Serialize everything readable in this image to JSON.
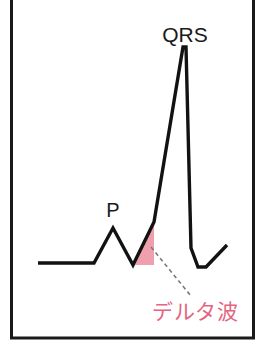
{
  "figure": {
    "background_color": "#ffffff",
    "frame": {
      "stroke_color": "#1a1a1a",
      "x": 11.5,
      "y": -6,
      "width": 242,
      "height": 344
    }
  },
  "labels": {
    "qrs": "QRS",
    "p": "P",
    "delta_wave": "デルタ波"
  },
  "colors": {
    "trace": "#121212",
    "delta_fill": "#ef9fae",
    "delta_text": "#e2667f",
    "leader_line": "#7a7a7a",
    "frame": "#1a1a1a"
  },
  "chart_data": {
    "type": "line",
    "xlabel": "",
    "ylabel": "",
    "grid": false,
    "legend": "none",
    "annotations": [
      {
        "name": "qrs-label",
        "text": "QRS",
        "x": 185,
        "y": 42,
        "color": "#1a1a1a"
      },
      {
        "name": "p-label",
        "text": "P",
        "x": 113,
        "y": 217,
        "color": "#1a1a1a"
      },
      {
        "name": "delta-label",
        "text": "デルタ波",
        "x": 195,
        "y": 312,
        "color": "#e2667f"
      }
    ],
    "series": [
      {
        "name": "ecg-trace",
        "color": "#121212",
        "points": [
          [
            38,
            263
          ],
          [
            94,
            263
          ],
          [
            113,
            228
          ],
          [
            133,
            265
          ],
          [
            154,
            222
          ],
          [
            183,
            47
          ],
          [
            186,
            47
          ],
          [
            191,
            248
          ],
          [
            198,
            267
          ],
          [
            206,
            267
          ],
          [
            227,
            245
          ]
        ]
      }
    ],
    "shaded_regions": [
      {
        "name": "delta-wave-region",
        "label": "デルタ波",
        "color": "#ef9fae",
        "polygon": [
          [
            135,
            265
          ],
          [
            154,
            222
          ],
          [
            154,
            265
          ]
        ]
      }
    ],
    "leader_lines": [
      {
        "name": "delta-leader",
        "from": [
          151,
          247
        ],
        "to": [
          191,
          296
        ]
      }
    ]
  }
}
